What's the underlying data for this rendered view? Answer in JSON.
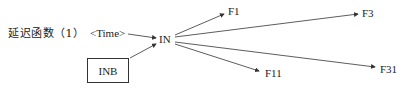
{
  "title": "延迟函数（1）",
  "nodes": {
    "time": "<Time>",
    "in": "IN",
    "inb": "INB",
    "f1": "F1",
    "f3": "F3",
    "f11": "F11",
    "f31": "F31"
  },
  "colors": {
    "line": "#333333",
    "text": "#222222"
  }
}
